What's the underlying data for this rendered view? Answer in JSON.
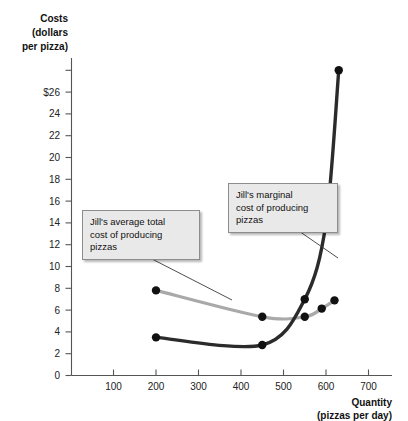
{
  "chart_data": {
    "type": "line",
    "title": "",
    "ylabel": "Costs (dollars per pizza)",
    "ylabel_line1": "Costs",
    "ylabel_line2": "(dollars",
    "ylabel_line3": "per pizza)",
    "xlabel": "Quantity",
    "xlabel_sub": "(pizzas per day)",
    "xlim": [
      0,
      740
    ],
    "ylim": [
      0,
      27.5
    ],
    "grid": false,
    "legend_position": "annotations",
    "yticks": [
      0,
      2,
      4,
      6,
      8,
      10,
      12,
      14,
      16,
      18,
      20,
      22,
      24,
      26
    ],
    "ytick_labels": [
      "0",
      "2",
      "4",
      "6",
      "8",
      "10",
      "12",
      "14",
      "16",
      "18",
      "20",
      "22",
      "24",
      "$26"
    ],
    "xticks": [
      100,
      200,
      300,
      400,
      500,
      600,
      700
    ],
    "xtick_labels": [
      "100",
      "200",
      "300",
      "400",
      "500",
      "600",
      "700"
    ],
    "series": [
      {
        "name": "Jill's average total cost of producing pizzas",
        "key": "atc",
        "color": "#a9a9a9",
        "points": [
          {
            "x": 200,
            "y": 7.25
          },
          {
            "x": 450,
            "y": 5.0
          },
          {
            "x": 550,
            "y": 5.0
          },
          {
            "x": 590,
            "y": 5.7
          },
          {
            "x": 620,
            "y": 6.4
          }
        ]
      },
      {
        "name": "Jill's marginal cost of producing pizzas",
        "key": "mc",
        "color": "#2b2b2b",
        "points": [
          {
            "x": 200,
            "y": 3.25
          },
          {
            "x": 450,
            "y": 2.6
          },
          {
            "x": 550,
            "y": 6.5
          },
          {
            "x": 600,
            "y": 13.0
          },
          {
            "x": 630,
            "y": 26.0
          }
        ]
      }
    ],
    "annotations": [
      {
        "key": "atc",
        "text": "Jill's average total cost of producing pizzas",
        "line1": "Jill's average total",
        "line2": "cost of producing",
        "line3": "pizzas"
      },
      {
        "key": "mc",
        "text": "Jill's marginal cost of producing pizzas",
        "line1": "Jill's marginal",
        "line2": "cost of producing",
        "line3": "pizzas"
      }
    ],
    "colors": {
      "atc": "#a9a9a9",
      "mc": "#2b2b2b",
      "axis": "#555555",
      "callout_bg": "#e9e9e9",
      "callout_border": "#8d8d8d",
      "background": "#ffffff"
    }
  }
}
